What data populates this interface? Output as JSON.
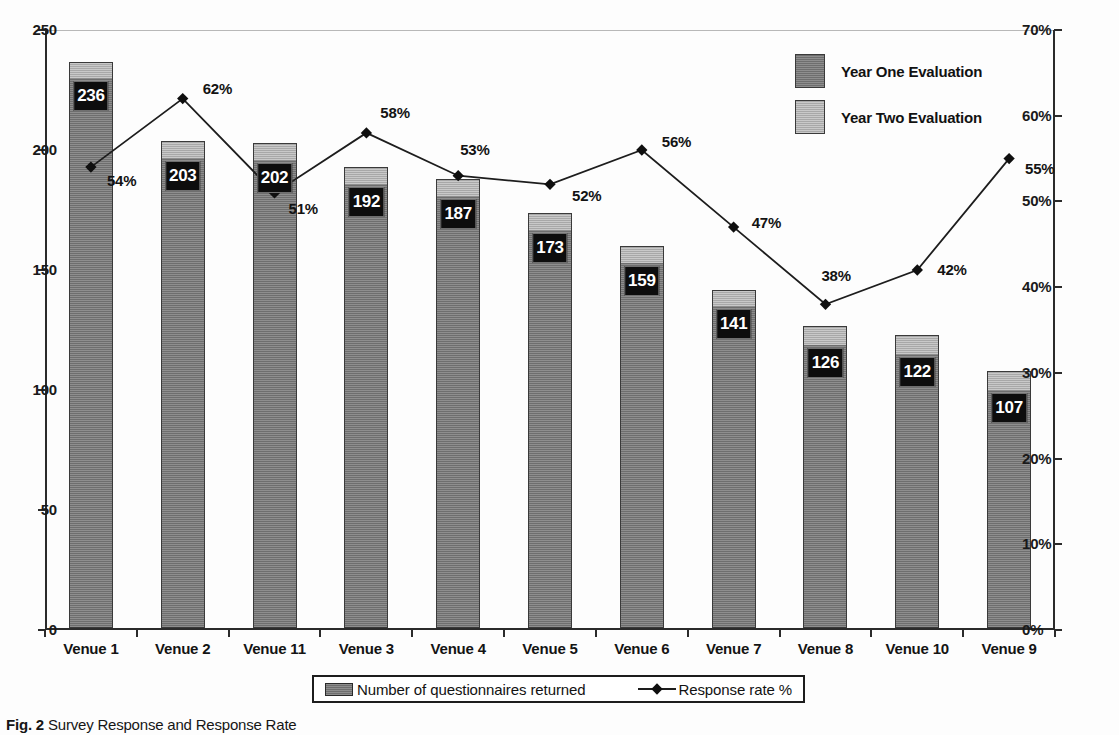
{
  "chart_data": {
    "type": "bar",
    "title": "",
    "subtitle": "",
    "xlabel": "",
    "ylabel": "",
    "ylabel_right": "",
    "grid": "top-gridline-only",
    "legend_position": "inside-top-right and below-axis",
    "categories": [
      "Venue 1",
      "Venue 2",
      "Venue 11",
      "Venue 3",
      "Venue 4",
      "Venue 5",
      "Venue 6",
      "Venue 7",
      "Venue 8",
      "Venue 10",
      "Venue 9"
    ],
    "ylim": [
      0,
      250
    ],
    "yticks": [
      "0",
      "50",
      "100",
      "150",
      "200",
      "250"
    ],
    "ylim_right": [
      0,
      70
    ],
    "yticks_right": [
      "0%",
      "10%",
      "20%",
      "30%",
      "40%",
      "50%",
      "60%",
      "70%"
    ],
    "series": [
      {
        "name": "Year One Evaluation",
        "kind": "bar-segment",
        "color": "#7d7d7d",
        "values": [
          229,
          196,
          195,
          185,
          180,
          166,
          152,
          134,
          118,
          114,
          99
        ]
      },
      {
        "name": "Year Two Evaluation",
        "kind": "bar-segment-top",
        "color": "#bcbcbc",
        "values": [
          7,
          7,
          7,
          7,
          7,
          7,
          7,
          7,
          8,
          8,
          8
        ]
      },
      {
        "name": "Response rate %",
        "kind": "line",
        "color": "#1d1d1d",
        "values": [
          54,
          62,
          51,
          58,
          53,
          52,
          56,
          47,
          38,
          42,
          55
        ],
        "labels": [
          "54%",
          "62%",
          "51%",
          "58%",
          "53%",
          "52%",
          "56%",
          "47%",
          "38%",
          "42%",
          "55%"
        ]
      }
    ],
    "bar_totals": [
      236,
      203,
      202,
      192,
      187,
      173,
      159,
      141,
      126,
      122,
      107
    ],
    "bar_total_labels": [
      "236",
      "203",
      "202",
      "192",
      "187",
      "173",
      "159",
      "141",
      "126",
      "122",
      "107"
    ]
  },
  "legend_series": {
    "items": [
      {
        "label": "Year One Evaluation",
        "swatch": "one"
      },
      {
        "label": "Year Two Evaluation",
        "swatch": "two"
      }
    ]
  },
  "legend_bottom": {
    "bar_label": "Number of questionnaires returned",
    "line_label": "Response rate %"
  },
  "caption": {
    "prefix": "Fig. 2",
    "text": "Survey Response and Response Rate"
  }
}
